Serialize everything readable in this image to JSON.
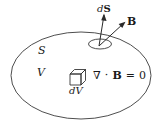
{
  "figure": {
    "stroke_color": "#3a3a3a",
    "text_color": "#1a1a1a",
    "background_color": "#ffffff"
  },
  "labels": {
    "surface": "S",
    "volume": "V",
    "surface_element": {
      "d": "d",
      "S": "S",
      "full": "dS"
    },
    "field": "B",
    "volume_element": "dV",
    "equation": {
      "nabla": "∇",
      "dot": "·",
      "field": "B",
      "equals": "=",
      "value": "0",
      "full": "∇ · B = 0"
    }
  },
  "shapes": {
    "outer_surface": "large-ellipse",
    "patch": "small-ellipse",
    "volume_element": "cube",
    "vectors": [
      "dS-normal-arrow",
      "B-field-arrow"
    ]
  }
}
